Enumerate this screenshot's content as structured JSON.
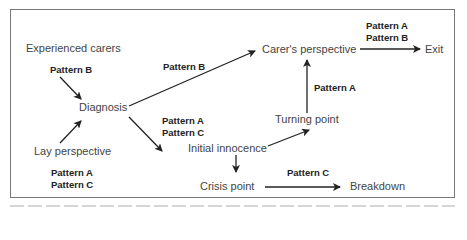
{
  "diagram": {
    "nodes": {
      "experienced_carers": "Experienced carers",
      "diagnosis": "Diagnosis",
      "lay_perspective": "Lay perspective",
      "carers_perspective": "Carer's perspective",
      "exit": "Exit",
      "turning_point": "Turning point",
      "initial_innocence": "Initial innocence",
      "crisis_point": "Crisis point",
      "breakdown": "Breakdown"
    },
    "labels": {
      "experienced_to_diagnosis": [
        "Pattern B"
      ],
      "diagnosis_to_carers": [
        "Pattern B"
      ],
      "carers_to_exit": [
        "Pattern A",
        "Pattern B"
      ],
      "turning_to_carers": [
        "Pattern A"
      ],
      "diagnosis_to_innocence": [
        "Pattern A",
        "Pattern C"
      ],
      "lay_perspective": [
        "Pattern A",
        "Pattern C"
      ],
      "crisis_to_breakdown": [
        "Pattern C"
      ]
    },
    "edges": [
      {
        "from": "Experienced carers",
        "to": "Diagnosis",
        "pattern": "Pattern B"
      },
      {
        "from": "Lay perspective",
        "to": "Diagnosis",
        "pattern": "Pattern A, Pattern C"
      },
      {
        "from": "Diagnosis",
        "to": "Carer's perspective",
        "pattern": "Pattern B"
      },
      {
        "from": "Diagnosis",
        "to": "Initial innocence",
        "pattern": "Pattern A, Pattern C"
      },
      {
        "from": "Initial innocence",
        "to": "Turning point",
        "pattern": ""
      },
      {
        "from": "Turning point",
        "to": "Carer's perspective",
        "pattern": "Pattern A"
      },
      {
        "from": "Carer's perspective",
        "to": "Exit",
        "pattern": "Pattern A, Pattern B"
      },
      {
        "from": "Initial innocence",
        "to": "Crisis point",
        "pattern": ""
      },
      {
        "from": "Crisis point",
        "to": "Breakdown",
        "pattern": "Pattern C"
      }
    ],
    "colors": {
      "frame": "#777777",
      "arrow": "#222222",
      "text": "#444444"
    }
  }
}
